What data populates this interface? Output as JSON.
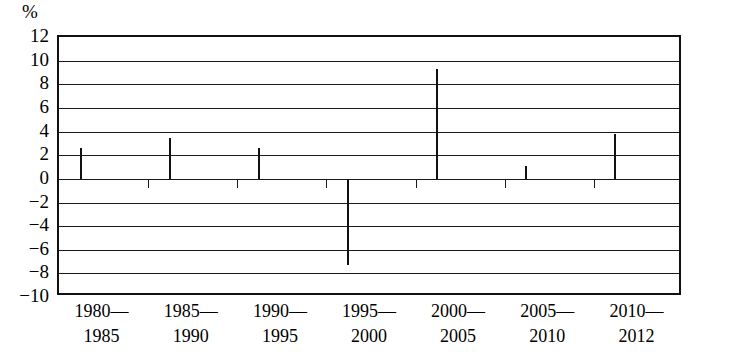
{
  "chart_data": {
    "type": "bar",
    "title": "",
    "subtitle": "",
    "xlabel": "",
    "ylabel": "%",
    "unit_label": "%",
    "grid": true,
    "legend": null,
    "ylim": [
      -10,
      12
    ],
    "ytick_step": 2,
    "yticks": [
      12,
      10,
      8,
      6,
      4,
      2,
      0,
      -2,
      -4,
      -6,
      -8,
      -10
    ],
    "ytick_labels": [
      "12",
      "10",
      "8",
      "6",
      "4",
      "2",
      "0",
      "−2",
      "−4",
      "−6",
      "−8",
      "−10"
    ],
    "categories": [
      "1980—1985",
      "1985—1990",
      "1990—1995",
      "1995—2000",
      "2000—2005",
      "2005—2010",
      "2010—2012"
    ],
    "category_lines": [
      {
        "line1": "1980—",
        "line2": "1985"
      },
      {
        "line1": "1985—",
        "line2": "1990"
      },
      {
        "line1": "1990—",
        "line2": "1995"
      },
      {
        "line1": "1995—",
        "line2": "2000"
      },
      {
        "line1": "2000—",
        "line2": "2005"
      },
      {
        "line1": "2005—",
        "line2": "2010"
      },
      {
        "line1": "2010—",
        "line2": "2012"
      }
    ],
    "values": [
      2.6,
      3.5,
      2.6,
      -7.3,
      9.3,
      1.1,
      3.8
    ],
    "bar_fill_color": "#58585a",
    "bar_edge_color": "#111111",
    "axis_color": "#1a1a1a",
    "background_color": "#ffffff"
  }
}
